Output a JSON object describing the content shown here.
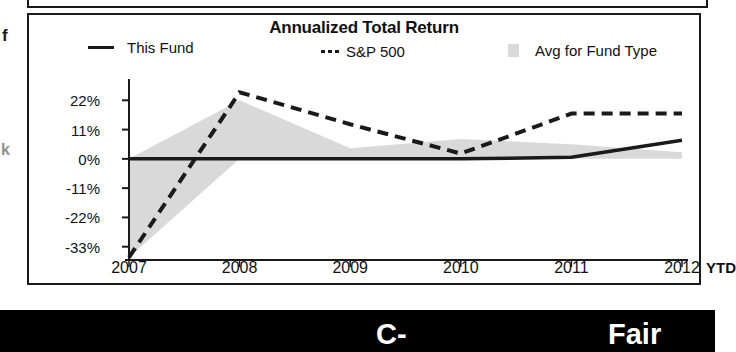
{
  "page": {
    "background_color": "#ffffff",
    "ink_color": "#1a1a1a"
  },
  "edge_artifacts": {
    "glyph_upper": "f",
    "glyph_lower": "k"
  },
  "chart_panel": {
    "title": "Annualized Total Return",
    "legend": [
      {
        "label": "This Fund",
        "marker": "solid-line-swatch",
        "color": "#1a1a1a"
      },
      {
        "label": "S&P 500",
        "marker": "dashed-line-swatch",
        "color": "#1a1a1a"
      },
      {
        "label": "Avg for Fund Type",
        "marker": "filled-square-swatch",
        "color": "#d9d9d9"
      }
    ],
    "x_axis_suffix": "YTD"
  },
  "rating_bar": {
    "grade": "C-",
    "word": "Fair",
    "background_color": "#000000",
    "text_color": "#ffffff"
  },
  "chart_data": {
    "type": "line",
    "title": "Annualized Total Return",
    "xlabel": "",
    "ylabel": "",
    "grid": false,
    "legend_position": "top",
    "categories": [
      "2007",
      "2008",
      "2009",
      "2010",
      "2011",
      "2012"
    ],
    "x_tick_labels": [
      "2007",
      "2008",
      "2009",
      "2010",
      "2011",
      "2012"
    ],
    "x_extra_label": "YTD",
    "y_tick_labels": [
      "22%",
      "11%",
      "0%",
      "-11%",
      "-22%",
      "-33%"
    ],
    "y_tick_values": [
      22,
      11,
      0,
      -11,
      -22,
      -33
    ],
    "ylim": [
      -38,
      27
    ],
    "series": [
      {
        "name": "This Fund",
        "style": "solid",
        "color": "#1a1a1a",
        "values": [
          0,
          0,
          0,
          0,
          0.6,
          7
        ]
      },
      {
        "name": "S&P 500",
        "style": "dashed",
        "color": "#1a1a1a",
        "values": [
          -37,
          25,
          13,
          2,
          17,
          17
        ]
      },
      {
        "name": "Avg for Fund Type",
        "style": "area",
        "color": "#d9d9d9",
        "values": [
          0,
          22,
          4,
          7.5,
          5.5,
          2.5
        ]
      }
    ],
    "notes": [
      "Avg for Fund Type is drawn as a light gray shaded band referenced to the 0% baseline.",
      "The 2007 segment of the gray band fills downward from 0% to the S&P 500 start value.",
      "The S&P 500 line is flat from 2011 to 2012."
    ]
  }
}
